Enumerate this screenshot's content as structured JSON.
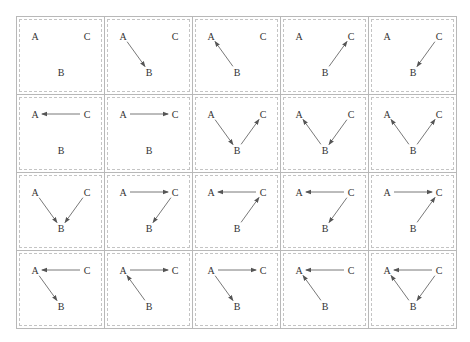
{
  "nodes": {
    "A": {
      "label": "A",
      "x": 18,
      "y": 19
    },
    "C": {
      "label": "C",
      "x": 70,
      "y": 19
    },
    "B": {
      "label": "B",
      "x": 44,
      "y": 55
    }
  },
  "grid": {
    "rows": 4,
    "cols": 5
  },
  "colors": {
    "edge": "#555555",
    "border": "#b8b8b8",
    "dashed": "#c4c4c4",
    "text": "#333333"
  },
  "cells": [
    {
      "edges": []
    },
    {
      "edges": [
        [
          "A",
          "B"
        ]
      ]
    },
    {
      "edges": [
        [
          "B",
          "A"
        ]
      ]
    },
    {
      "edges": [
        [
          "B",
          "C"
        ]
      ]
    },
    {
      "edges": [
        [
          "C",
          "B"
        ]
      ]
    },
    {
      "edges": [
        [
          "C",
          "A"
        ]
      ]
    },
    {
      "edges": [
        [
          "A",
          "C"
        ]
      ]
    },
    {
      "edges": [
        [
          "A",
          "B"
        ],
        [
          "B",
          "C"
        ]
      ]
    },
    {
      "edges": [
        [
          "B",
          "A"
        ],
        [
          "C",
          "B"
        ]
      ]
    },
    {
      "edges": [
        [
          "B",
          "A"
        ],
        [
          "B",
          "C"
        ]
      ]
    },
    {
      "edges": [
        [
          "A",
          "B"
        ],
        [
          "C",
          "B"
        ]
      ]
    },
    {
      "edges": [
        [
          "A",
          "C"
        ],
        [
          "C",
          "B"
        ]
      ]
    },
    {
      "edges": [
        [
          "C",
          "A"
        ],
        [
          "B",
          "C"
        ]
      ]
    },
    {
      "edges": [
        [
          "C",
          "A"
        ],
        [
          "C",
          "B"
        ]
      ]
    },
    {
      "edges": [
        [
          "A",
          "C"
        ],
        [
          "B",
          "C"
        ]
      ]
    },
    {
      "edges": [
        [
          "C",
          "A"
        ],
        [
          "A",
          "B"
        ]
      ]
    },
    {
      "edges": [
        [
          "A",
          "C"
        ],
        [
          "B",
          "A"
        ]
      ]
    },
    {
      "edges": [
        [
          "A",
          "C"
        ],
        [
          "A",
          "B"
        ]
      ]
    },
    {
      "edges": [
        [
          "C",
          "A"
        ],
        [
          "B",
          "A"
        ]
      ]
    },
    {
      "edges": [
        [
          "C",
          "A"
        ],
        [
          "B",
          "A"
        ],
        [
          "C",
          "B"
        ]
      ]
    }
  ]
}
